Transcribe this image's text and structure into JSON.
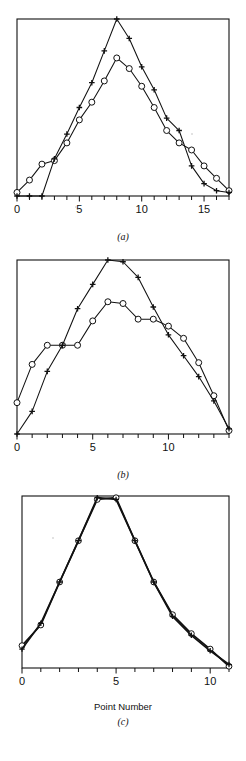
{
  "figure": {
    "background": "#ffffff",
    "ink": "#111111",
    "panels": [
      {
        "id": "a",
        "caption": "(a)",
        "xlabel": "",
        "xticks": [
          0,
          5,
          10,
          15
        ],
        "xtick_labels": [
          "0",
          "5",
          "10",
          "15"
        ]
      },
      {
        "id": "b",
        "caption": "(b)",
        "xlabel": "",
        "xticks": [
          0,
          5,
          10
        ],
        "xtick_labels": [
          "0",
          "5",
          "10"
        ]
      },
      {
        "id": "c",
        "caption": "(c)",
        "xlabel": "Point Number",
        "xticks": [
          0,
          5,
          10
        ],
        "xtick_labels": [
          "0",
          "5",
          "10"
        ]
      }
    ]
  },
  "chart_data": [
    {
      "type": "line",
      "title": "(a)",
      "xlabel": "",
      "ylabel": "",
      "xlim": [
        0,
        17
      ],
      "ylim": [
        0,
        1.0
      ],
      "grid": false,
      "legend": "none",
      "x": [
        0,
        1,
        2,
        3,
        4,
        5,
        6,
        7,
        8,
        9,
        10,
        11,
        12,
        13,
        14,
        15,
        16,
        17
      ],
      "series": [
        {
          "name": "circle-series",
          "marker": "circle",
          "values": [
            0.02,
            0.09,
            0.18,
            0.2,
            0.3,
            0.43,
            0.53,
            0.65,
            0.78,
            0.72,
            0.62,
            0.5,
            0.37,
            0.3,
            0.26,
            0.17,
            0.1,
            0.03
          ]
        },
        {
          "name": "cross-series",
          "marker": "cross",
          "values": [
            0.0,
            0.0,
            0.0,
            0.21,
            0.35,
            0.5,
            0.64,
            0.82,
            1.0,
            0.89,
            0.73,
            0.6,
            0.44,
            0.37,
            0.17,
            0.07,
            0.03,
            0.02
          ]
        }
      ]
    },
    {
      "type": "line",
      "title": "(b)",
      "xlabel": "",
      "ylabel": "",
      "xlim": [
        0,
        14
      ],
      "ylim": [
        0,
        1.0
      ],
      "grid": false,
      "legend": "none",
      "x": [
        0,
        1,
        2,
        3,
        4,
        5,
        6,
        7,
        8,
        9,
        10,
        11,
        12,
        13,
        14
      ],
      "series": [
        {
          "name": "circle-series",
          "marker": "circle",
          "values": [
            0.18,
            0.4,
            0.51,
            0.51,
            0.51,
            0.65,
            0.76,
            0.75,
            0.66,
            0.66,
            0.62,
            0.55,
            0.41,
            0.22,
            0.02
          ]
        },
        {
          "name": "cross-series",
          "marker": "cross",
          "values": [
            0.0,
            0.13,
            0.36,
            0.51,
            0.72,
            0.86,
            1.0,
            0.99,
            0.9,
            0.73,
            0.57,
            0.45,
            0.33,
            0.19,
            0.03
          ]
        }
      ]
    },
    {
      "type": "line",
      "title": "(c)",
      "xlabel": "Point Number",
      "ylabel": "",
      "xlim": [
        0,
        11
      ],
      "ylim": [
        0,
        1.0
      ],
      "grid": false,
      "legend": "none",
      "x": [
        0,
        1,
        2,
        3,
        4,
        5,
        6,
        7,
        8,
        9,
        10,
        11
      ],
      "series": [
        {
          "name": "circle-series",
          "marker": "circle",
          "values": [
            0.13,
            0.25,
            0.5,
            0.74,
            0.98,
            0.99,
            0.74,
            0.5,
            0.31,
            0.2,
            0.11,
            0.01
          ]
        },
        {
          "name": "cross-series",
          "marker": "cross",
          "values": [
            0.11,
            0.26,
            0.5,
            0.74,
            0.99,
            0.98,
            0.74,
            0.5,
            0.3,
            0.19,
            0.1,
            0.02
          ]
        }
      ]
    }
  ]
}
